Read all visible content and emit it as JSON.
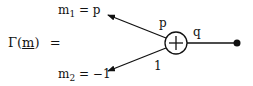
{
  "lhs": {
    "func": "Γ(",
    "arg": "m",
    "close": ")",
    "eq": "="
  },
  "m1": {
    "name": "m",
    "sub": "1",
    "rest": "= p"
  },
  "m2": {
    "name": "m",
    "sub": "2",
    "rest": "= −1"
  },
  "edges": {
    "upper_label": "p",
    "lower_label": "1",
    "right_label": "q"
  },
  "node": {
    "symbol": "+"
  }
}
